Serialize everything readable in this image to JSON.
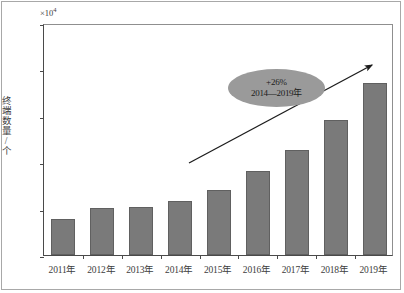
{
  "chart_data": {
    "type": "bar",
    "title": "",
    "xlabel": "",
    "ylabel": "终端数量/个",
    "y_multiplier": "×10",
    "y_multiplier_exponent": "4",
    "categories": [
      "2011年",
      "2012年",
      "2013年",
      "2014年",
      "2015年",
      "2016年",
      "2017年",
      "2018年",
      "2019年"
    ],
    "values": [
      39,
      51,
      52,
      58,
      70,
      90,
      113,
      145,
      185
    ],
    "yticks": [
      0,
      50,
      100,
      150,
      200,
      250
    ],
    "ylim": [
      0,
      250
    ],
    "grid": false,
    "legend": null,
    "bar_color": "#7a7a7a",
    "axis_color": "#4a4a4a",
    "annotations": [
      {
        "type": "ellipse-callout",
        "percent_label": "+26%",
        "range_label": "2014—2019年",
        "fill_color": "#9a9a9a"
      },
      {
        "type": "trend-arrow",
        "direction": "up-right",
        "color": "#1c1c1c"
      }
    ]
  }
}
